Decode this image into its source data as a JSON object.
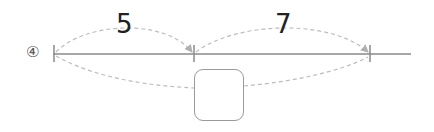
{
  "problem": {
    "number_marker": "④"
  },
  "diagram": {
    "segment_labels": [
      {
        "text": "5",
        "from": "left-tick",
        "to": "middle-tick"
      },
      {
        "text": "7",
        "from": "middle-tick",
        "to": "right-tick"
      }
    ],
    "answer_box": {
      "value": ""
    },
    "colors": {
      "line": "#8a8a8a",
      "dashed": "#bdbdbd",
      "box_border": "#9a9a9a",
      "label_text": "#222222"
    }
  }
}
